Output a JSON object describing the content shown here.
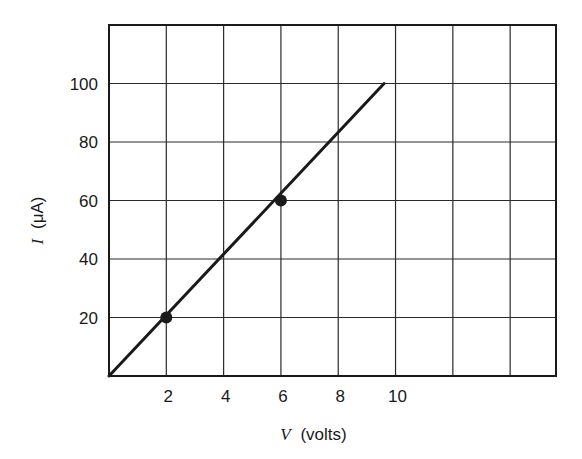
{
  "chart_data": {
    "type": "line",
    "title": "",
    "xlabel": "V (volts)",
    "xlabel_var": "V",
    "xlabel_unit": "(volts)",
    "ylabel": "I (μA)",
    "ylabel_var": "I",
    "ylabel_unit": "(μA)",
    "xlim": [
      0,
      15.6
    ],
    "ylim": [
      0,
      120
    ],
    "x_ticks": [
      2,
      4,
      6,
      8,
      10
    ],
    "x_tick_labels": [
      "2",
      "4",
      "6",
      "8",
      "10"
    ],
    "x_gridlines": [
      2,
      4,
      6,
      8,
      10,
      12,
      14
    ],
    "y_ticks": [
      20,
      40,
      60,
      80,
      100
    ],
    "y_tick_labels": [
      "20",
      "40",
      "60",
      "80",
      "100"
    ],
    "y_gridlines": [
      20,
      40,
      60,
      80,
      100
    ],
    "grid": true,
    "legend": null,
    "series": [
      {
        "name": "I vs V (linear fit)",
        "style": "line",
        "x": [
          0,
          9.6
        ],
        "y": [
          0,
          100
        ]
      },
      {
        "name": "measured points",
        "style": "markers",
        "x": [
          2,
          6
        ],
        "y": [
          20,
          60
        ]
      }
    ],
    "colors": {
      "line": "#1a1a1a",
      "grid": "#2a2a2a",
      "background": "#ffffff"
    }
  }
}
